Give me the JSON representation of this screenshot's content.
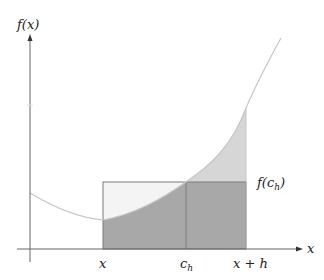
{
  "figure": {
    "labels": {
      "y_axis": "f(x)",
      "x_axis": "x",
      "x_tick_left": "x",
      "x_tick_mid": "c",
      "x_tick_mid_sub": "h",
      "x_tick_right": "x + h",
      "rect_height_label": "f(c",
      "rect_height_label_sub": "h",
      "rect_height_label_close": ")"
    },
    "colors": {
      "axis": "#666666",
      "curve": "#c8c8c8",
      "area_under_curve": "#a9a9a9",
      "excess_area_above_rect": "#d9d9d9",
      "rect_fill_light": "#f3f3f3",
      "rect_outline": "#777777"
    }
  }
}
